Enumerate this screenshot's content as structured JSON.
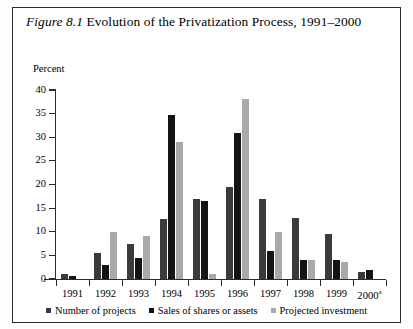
{
  "figure": {
    "number": "Figure 8.1",
    "caption": "Evolution of the Privatization Process, 1991–2000",
    "title_full": "Figure 8.1 Evolution of the Privatization Process, 1991–2000"
  },
  "axis": {
    "y_title": "Percent",
    "y_ticks": [
      "40",
      "35",
      "30",
      "25",
      "20",
      "15",
      "10",
      "5",
      "0"
    ],
    "x_labels": [
      "1991",
      "1992",
      "1993",
      "1994",
      "1995",
      "1996",
      "1997",
      "1998",
      "1999",
      "2000"
    ],
    "x_last_superscript": "a"
  },
  "legend": {
    "items": [
      {
        "label": "Number of projects",
        "color": "#3a3a3a"
      },
      {
        "label": "Sales of shares or assets",
        "color": "#141414"
      },
      {
        "label": "Projected investment",
        "color": "#a9a9a9"
      }
    ]
  },
  "colors": {
    "number_of_projects": "#3a3a3a",
    "sales_of_shares_or_assets": "#141414",
    "projected_investment": "#a9a9a9",
    "axis": "#2b2b2b",
    "frame": "#2b2b2b",
    "background": "#ffffff"
  },
  "chart_data": {
    "type": "bar",
    "title": "Figure 8.1 Evolution of the Privatization Process, 1991–2000",
    "xlabel": "",
    "ylabel": "Percent",
    "ylim": [
      0,
      40
    ],
    "yticks": [
      0,
      5,
      10,
      15,
      20,
      25,
      30,
      35,
      40
    ],
    "grid": false,
    "legend_position": "bottom",
    "categories": [
      "1991",
      "1992",
      "1993",
      "1994",
      "1995",
      "1996",
      "1997",
      "1998",
      "1999",
      "2000a"
    ],
    "series": [
      {
        "name": "Number of projects",
        "color": "#3a3a3a",
        "values": [
          1.0,
          5.5,
          7.5,
          12.8,
          17.0,
          19.5,
          17.0,
          13.0,
          9.5,
          1.5
        ]
      },
      {
        "name": "Sales of shares or assets",
        "color": "#141414",
        "values": [
          0.7,
          3.0,
          4.5,
          34.8,
          16.5,
          31.0,
          6.0,
          4.0,
          4.0,
          2.0
        ]
      },
      {
        "name": "Projected investment",
        "color": "#a9a9a9",
        "values": [
          0.0,
          10.0,
          9.0,
          29.0,
          1.0,
          38.0,
          10.0,
          4.0,
          3.5,
          0.0
        ]
      }
    ]
  }
}
